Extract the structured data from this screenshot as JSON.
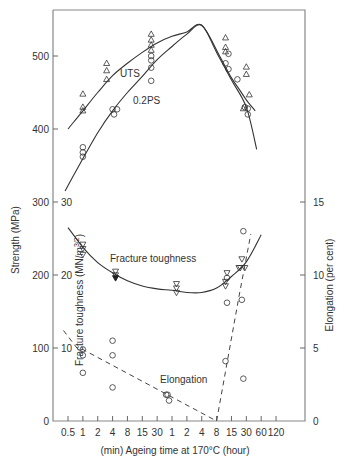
{
  "chart_data": {
    "type": "scatter",
    "title": "",
    "xlabel": "(min) Ageing time at 170°C (hour)",
    "ylabel_left": "Strength (MPa)",
    "ylabel_left_inner": "Fracture toughness (MN/m^3/2)",
    "ylabel_left_inner_main": "Fracture toughness (MN/m",
    "ylabel_left_inner_sup": "3/2",
    "ylabel_left_inner_close": ")",
    "ylabel_right": "Elongation (per cent)",
    "x_ticks": [
      "0.5",
      "1",
      "2",
      "4",
      "8",
      "15",
      "30",
      "1",
      "2",
      "4",
      "8",
      "15",
      "30",
      "60",
      "120"
    ],
    "x_tick_units": [
      "min",
      "min",
      "min",
      "min",
      "min",
      "min",
      "min",
      "h",
      "h",
      "h",
      "h",
      "h",
      "h",
      "h",
      "h"
    ],
    "y_left_ticks": [
      "0",
      "100",
      "200",
      "300",
      "400",
      "500"
    ],
    "y_left_range": [
      0,
      560
    ],
    "y_inner_ticks": [
      "10",
      "20",
      "30"
    ],
    "y_right_ticks": [
      "0",
      "5",
      "10",
      "15"
    ],
    "y_right_range": [
      0,
      19
    ],
    "grid": false,
    "annotations": [
      "UTS",
      "0.2PS",
      "Fracture toughness",
      "Elongation"
    ],
    "series": [
      {
        "name": "UTS",
        "marker": "triangle-up",
        "axis": "left",
        "unit": "MPa",
        "points": [
          [
            1,
            448
          ],
          [
            1,
            430
          ],
          [
            1,
            425
          ],
          [
            2.6,
            490
          ],
          [
            2.6,
            480
          ],
          [
            2.6,
            468
          ],
          [
            5.6,
            530
          ],
          [
            5.6,
            522
          ],
          [
            5.6,
            515
          ],
          [
            5.6,
            508
          ],
          [
            10.6,
            525
          ],
          [
            10.6,
            512
          ],
          [
            10.6,
            506
          ],
          [
            12,
            485
          ],
          [
            12,
            475
          ],
          [
            12.2,
            447
          ],
          [
            11.8,
            428
          ]
        ],
        "curve": [
          [
            0,
            400
          ],
          [
            1,
            425
          ],
          [
            2,
            450
          ],
          [
            3,
            473
          ],
          [
            4,
            490
          ],
          [
            5,
            505
          ],
          [
            6,
            518
          ],
          [
            7,
            527
          ],
          [
            8,
            533
          ],
          [
            9,
            542
          ],
          [
            10.2,
            500
          ],
          [
            11,
            470
          ],
          [
            11.5,
            455
          ],
          [
            12,
            440
          ],
          [
            12.6,
            425
          ]
        ]
      },
      {
        "name": "0.2PS",
        "marker": "circle",
        "axis": "left",
        "unit": "MPa",
        "points": [
          [
            1,
            375
          ],
          [
            1,
            368
          ],
          [
            1,
            362
          ],
          [
            3,
            427
          ],
          [
            3.3,
            427
          ],
          [
            3.1,
            420
          ],
          [
            5.6,
            500
          ],
          [
            5.6,
            494
          ],
          [
            5.6,
            484
          ],
          [
            5.6,
            466
          ],
          [
            10.8,
            503
          ],
          [
            10.6,
            490
          ],
          [
            10.8,
            482
          ],
          [
            11.4,
            468
          ],
          [
            11.9,
            430
          ],
          [
            12.1,
            428
          ],
          [
            12.1,
            420
          ]
        ],
        "curve": [
          [
            -0.2,
            315
          ],
          [
            0.8,
            352
          ],
          [
            2,
            395
          ],
          [
            3,
            425
          ],
          [
            4,
            450
          ],
          [
            5,
            472
          ],
          [
            6,
            495
          ],
          [
            7,
            513
          ],
          [
            8,
            530
          ],
          [
            9,
            542
          ],
          [
            10,
            505
          ],
          [
            11,
            467
          ],
          [
            12,
            430
          ],
          [
            12.7,
            372
          ]
        ]
      },
      {
        "name": "Fracture toughness",
        "marker": "triangle-down",
        "axis": "inner_left",
        "unit": "MN/m^3/2",
        "points": [
          [
            1,
            24.2
          ],
          [
            1,
            23.6
          ],
          [
            1,
            22.8
          ],
          [
            3.2,
            20.5
          ],
          [
            3.2,
            20.0
          ],
          [
            3.2,
            19.6
          ],
          [
            7.3,
            18.8
          ],
          [
            7.3,
            18.2
          ],
          [
            7.3,
            17.6
          ],
          [
            10.7,
            20.3
          ],
          [
            10.6,
            19.1
          ],
          [
            10.6,
            18.5
          ],
          [
            11.6,
            21.0
          ],
          [
            11.5,
            21.0
          ],
          [
            11.9,
            21.0
          ],
          [
            11.7,
            22.2
          ]
        ],
        "curve": [
          [
            0,
            26.5
          ],
          [
            1,
            23.8
          ],
          [
            2,
            21.7
          ],
          [
            3,
            20.3
          ],
          [
            4,
            19.2
          ],
          [
            5,
            18.5
          ],
          [
            6,
            18.1
          ],
          [
            7,
            17.9
          ],
          [
            8,
            17.6
          ],
          [
            9,
            17.6
          ],
          [
            10,
            18.2
          ],
          [
            11,
            19.8
          ],
          [
            12,
            21.8
          ],
          [
            13,
            25.5
          ]
        ]
      },
      {
        "name": "Elongation",
        "marker": "circle",
        "axis": "right",
        "unit": "per cent",
        "points": [
          [
            1,
            4.9
          ],
          [
            1,
            4.5
          ],
          [
            1,
            3.3
          ],
          [
            3,
            5.5
          ],
          [
            3,
            4.5
          ],
          [
            3,
            2.3
          ],
          [
            6.6,
            1.8
          ],
          [
            6.7,
            1.8
          ],
          [
            6.8,
            1.4
          ],
          [
            10.7,
            9.8
          ],
          [
            10.7,
            8.1
          ],
          [
            10.6,
            4.1
          ],
          [
            11.8,
            13.0
          ],
          [
            11.7,
            8.3
          ],
          [
            11.8,
            2.9
          ]
        ],
        "curve_dashed": [
          [
            -0.3,
            6.2
          ],
          [
            0.6,
            5.0
          ],
          [
            1.0,
            4.9
          ],
          [
            10,
            0
          ],
          [
            11.5,
            8.5
          ],
          [
            12.3,
            12.8
          ]
        ]
      }
    ]
  }
}
